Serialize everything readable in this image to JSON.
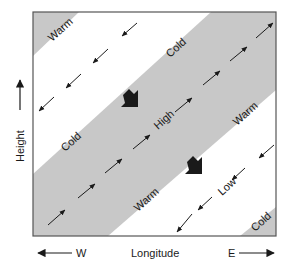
{
  "diagram": {
    "axes": {
      "y_label": "Height",
      "x_label": "Longitude",
      "west_label": "W",
      "east_label": "E"
    },
    "colors": {
      "band_fill": "#c8c8c8",
      "frame": "#555555",
      "ink": "#1a1a1a",
      "background": "#ffffff"
    },
    "regions": {
      "top_left_triangle": {
        "label": "Warm"
      },
      "cold_upper": {
        "label": "Cold"
      },
      "cold_left": {
        "label": "Cold"
      },
      "high_band": {
        "label": "High"
      },
      "warm_band_lower": {
        "label": "Warm"
      },
      "warm_right": {
        "label": "Warm"
      },
      "low_band": {
        "label": "Low"
      },
      "bottom_right_triangle": {
        "label": "Cold"
      }
    },
    "flow": {
      "high_band_arrows": "northeast",
      "white_band_arrows": "southwest",
      "bold_arrows": "southeast"
    }
  }
}
